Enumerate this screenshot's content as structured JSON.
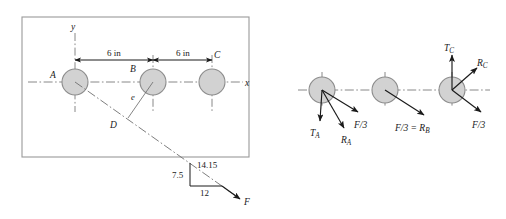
{
  "figure": {
    "colors": {
      "circle_fill": "#d2d2d2",
      "circle_stroke": "#8c8c8c",
      "line": "#1a1a1a",
      "centerline": "#7a7a7a",
      "frame": "#9a9a9a",
      "background": "#ffffff"
    }
  },
  "layout_diagram": {
    "name": "shaft-layout-diagram",
    "axes": {
      "y_label": "y",
      "x_label": "x"
    },
    "gears": [
      {
        "id": "A",
        "label": "A",
        "cx": 75,
        "cy": 82,
        "r": 13
      },
      {
        "id": "B",
        "label": "B",
        "cx": 153,
        "cy": 82,
        "r": 13
      },
      {
        "id": "C",
        "label": "C",
        "cx": 212,
        "cy": 82,
        "r": 13
      }
    ],
    "dimensions": [
      {
        "name": "span-A-to-B",
        "label": "6 in",
        "from_x": 75,
        "to_x": 153,
        "y": 60
      },
      {
        "name": "span-B-to-C",
        "label": "6 in",
        "from_x": 153,
        "to_x": 212,
        "y": 60
      }
    ],
    "eccentricity": {
      "label": "e",
      "point_label": "D"
    },
    "force_triangle": {
      "hypotenuse_label": "14.15",
      "vertical_label": "7.5",
      "horizontal_label": "12",
      "force_label": "F"
    }
  },
  "fbd_diagram": {
    "name": "free-body-diagrams",
    "bodies": [
      {
        "id": "A",
        "cx": 322,
        "cy": 90,
        "r": 13,
        "vectors": [
          {
            "name": "tension-A",
            "label": "T",
            "sub": "A",
            "dir": "down"
          },
          {
            "name": "reaction-A",
            "label": "R",
            "sub": "A",
            "dir": "down-right-steep"
          },
          {
            "name": "force-third-A",
            "label": "F/3",
            "sub": "",
            "dir": "down-right-shallow"
          }
        ]
      },
      {
        "id": "B",
        "cx": 385,
        "cy": 90,
        "r": 13,
        "vectors": [
          {
            "name": "force-third-equals-RB",
            "label": "F/3 = R",
            "sub": "B",
            "dir": "down-right-shallow"
          }
        ]
      },
      {
        "id": "C",
        "cx": 452,
        "cy": 90,
        "r": 13,
        "vectors": [
          {
            "name": "tension-C",
            "label": "T",
            "sub": "C",
            "dir": "up"
          },
          {
            "name": "reaction-C",
            "label": "R",
            "sub": "C",
            "dir": "up-right"
          },
          {
            "name": "force-third-C",
            "label": "F/3",
            "sub": "",
            "dir": "down-right-shallow"
          }
        ]
      }
    ]
  },
  "text": {
    "six_in_1": "6 in",
    "six_in_2": "6 in",
    "label_A": "A",
    "label_B": "B",
    "label_C": "C",
    "label_D": "D",
    "label_e": "e",
    "label_x": "x",
    "label_y": "y",
    "label_F": "F",
    "dim_1415": "14.15",
    "dim_75": "7.5",
    "dim_12": "12",
    "T_base": "T",
    "R_base": "R",
    "sub_A": "A",
    "sub_B": "B",
    "sub_C": "C",
    "f_over_3": "F/3",
    "f_over_3_eq_R": "F/3 = R"
  }
}
